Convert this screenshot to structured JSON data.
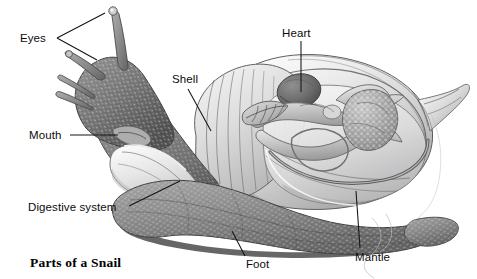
{
  "figure": {
    "title": "Parts of a Snail",
    "style": "grayscale pencil illustration",
    "background_color": "#ffffff",
    "ink_color": "#141414"
  },
  "labels": [
    {
      "id": "eyes",
      "text": "Eyes",
      "text_x": 20,
      "text_y": 42,
      "anchor": "start",
      "leader": "M57,38 L105,13 M57,38 L97,60",
      "leader_kind": "forked",
      "points_to": "eye-stalk-tentacle-tips"
    },
    {
      "id": "mouth",
      "text": "Mouth",
      "text_x": 29,
      "text_y": 139,
      "anchor": "start",
      "leader": "M70,135 L118,135",
      "leader_kind": "straight",
      "points_to": "mouth-opening"
    },
    {
      "id": "digestive-system",
      "text": "Digestive system",
      "text_x": 28,
      "text_y": 211,
      "anchor": "start",
      "leader": "M129,206 L180,181",
      "leader_kind": "straight",
      "points_to": "digestive-mass"
    },
    {
      "id": "shell",
      "text": "Shell",
      "text_x": 172,
      "text_y": 83,
      "anchor": "start",
      "leader": "M188,89 L211,131",
      "leader_kind": "straight",
      "points_to": "shell-surface"
    },
    {
      "id": "heart",
      "text": "Heart",
      "text_x": 282,
      "text_y": 37,
      "anchor": "start",
      "leader": "M301,41 L301,92",
      "leader_kind": "straight",
      "points_to": "heart-organ"
    },
    {
      "id": "foot",
      "text": "Foot",
      "text_x": 246,
      "text_y": 268,
      "anchor": "start",
      "leader": "M245,256 L232,231",
      "leader_kind": "straight",
      "points_to": "muscular-foot"
    },
    {
      "id": "mantle",
      "text": "Mantle",
      "text_x": 355,
      "text_y": 261,
      "anchor": "start",
      "leader": "M360,248 L356,191",
      "leader_kind": "straight",
      "points_to": "mantle-edge"
    }
  ]
}
